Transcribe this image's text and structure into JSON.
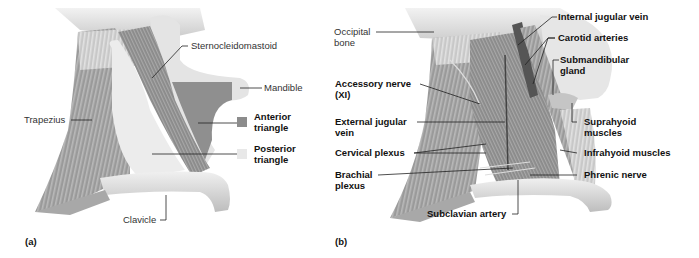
{
  "figure": {
    "panels": [
      {
        "id": "a",
        "letter": "(a)",
        "labels": {
          "sternocleidomastoid": "Sternocleidomastoid",
          "mandible": "Mandible",
          "trapezius": "Trapezius",
          "clavicle": "Clavicle",
          "anterior_triangle_1": "Anterior",
          "anterior_triangle_2": "triangle",
          "posterior_triangle_1": "Posterior",
          "posterior_triangle_2": "triangle"
        },
        "legend": [
          {
            "name": "Anterior triangle",
            "color": "#8c8c8c"
          },
          {
            "name": "Posterior triangle",
            "color": "#e8e8e8"
          }
        ]
      },
      {
        "id": "b",
        "letter": "(b)",
        "labels": {
          "occipital_1": "Occipital",
          "occipital_2": "bone",
          "accessory_1": "Accessory nerve",
          "accessory_2": "(XI)",
          "ext_jugular_1": "External jugular",
          "ext_jugular_2": "vein",
          "cervical_plexus": "Cervical plexus",
          "brachial_1": "Brachial",
          "brachial_2": "plexus",
          "internal_jugular": "Internal jugular vein",
          "carotid": "Carotid arteries",
          "submandibular_1": "Submandibular",
          "submandibular_2": "gland",
          "suprahyoid_1": "Suprahyoid",
          "suprahyoid_2": "muscles",
          "infrahyoid": "Infrahyoid muscles",
          "phrenic": "Phrenic nerve",
          "subclavian": "Subclavian artery"
        }
      }
    ]
  }
}
